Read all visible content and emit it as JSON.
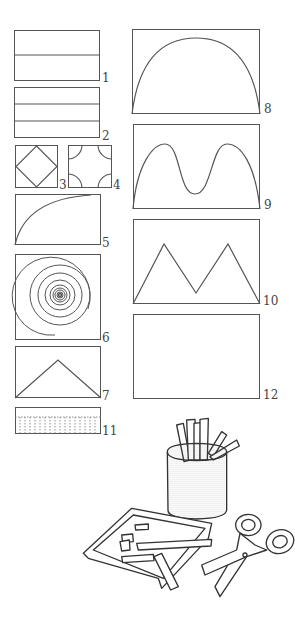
{
  "figures": [
    {
      "id": 1,
      "label": "1",
      "description": "rectangle divided into 2 horizontal strips"
    },
    {
      "id": 2,
      "label": "2",
      "description": "rectangle divided into 3 horizontal strips"
    },
    {
      "id": 3,
      "label": "3",
      "description": "square with inscribed diamond (corners cut)"
    },
    {
      "id": 4,
      "label": "4",
      "description": "square with four concave quarter-circle corners"
    },
    {
      "id": 5,
      "label": "5",
      "description": "rectangle with quarter-curve from bottom-left to top-right"
    },
    {
      "id": 6,
      "label": "6",
      "description": "square with spiral"
    },
    {
      "id": 7,
      "label": "7",
      "description": "rectangle with triangle peak"
    },
    {
      "id": 8,
      "label": "8",
      "description": "rectangle with single arch"
    },
    {
      "id": 9,
      "label": "9",
      "description": "rectangle with double hump curve"
    },
    {
      "id": 10,
      "label": "10",
      "description": "rectangle with zigzag M shape"
    },
    {
      "id": 11,
      "label": "11",
      "description": "thin strip with dotted fringe"
    },
    {
      "id": 12,
      "label": "12",
      "description": "empty rectangle"
    }
  ],
  "illustration": {
    "description": "pencil cup with paper strips, tray with paper scraps, scissors"
  }
}
